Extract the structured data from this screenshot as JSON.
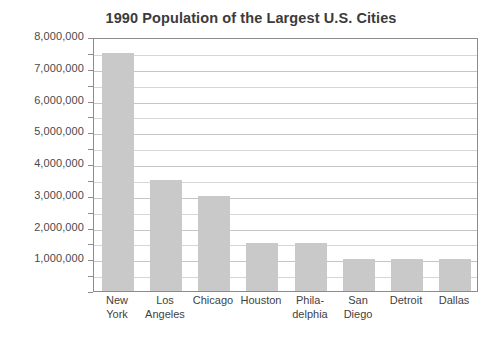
{
  "chart_data": {
    "type": "bar",
    "title": "1990 Population of the Largest U.S. Cities",
    "xlabel": "",
    "ylabel": "",
    "categories": [
      "New York",
      "Los Angeles",
      "Chicago",
      "Houston",
      "Philadelphia",
      "San Diego",
      "Detroit",
      "Dallas"
    ],
    "category_lines": [
      [
        "New",
        "York"
      ],
      [
        "Los",
        "Angeles"
      ],
      [
        "Chicago",
        ""
      ],
      [
        "Houston",
        ""
      ],
      [
        "Phila-",
        "delphia"
      ],
      [
        "San",
        "Diego"
      ],
      [
        "Detroit",
        ""
      ],
      [
        "Dallas",
        ""
      ]
    ],
    "values": [
      7500000,
      3500000,
      3000000,
      1500000,
      1500000,
      1000000,
      1000000,
      1000000
    ],
    "ylim": [
      0,
      8000000
    ],
    "ytick_labels": [
      "8,000,000",
      "7,000,000",
      "6,000,000",
      "5,000,000",
      "4,000,000",
      "3,000,000",
      "2,000,000",
      "1,000,000"
    ],
    "ytick_values": [
      8000000,
      7000000,
      6000000,
      5000000,
      4000000,
      3000000,
      2000000,
      1000000
    ],
    "gridline_interval": 500000,
    "grid": true,
    "legend": false,
    "legend_position": "none",
    "bar_color": "#c9c9c9",
    "grid_color": "#d6d6d6",
    "axis_color": "#8c8c8c",
    "title_color": "#3b3b3b",
    "background_color": "#ffffff"
  }
}
